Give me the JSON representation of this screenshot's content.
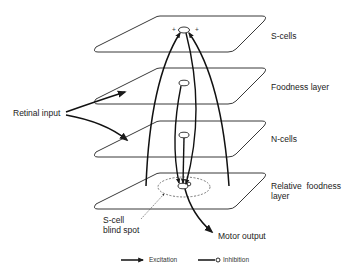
{
  "diagram": {
    "layers": [
      {
        "id": "s-cells",
        "label": "S-cells"
      },
      {
        "id": "foodness",
        "label": "Foodness layer"
      },
      {
        "id": "n-cells",
        "label": "N-cells"
      },
      {
        "id": "relative-foodness",
        "label_line1": "Relative  foodness",
        "label_line2": "layer"
      }
    ],
    "inputs": {
      "retinal": "Retinal input"
    },
    "outputs": {
      "motor": "Motor output"
    },
    "annotations": {
      "blind_spot_line1": "S-cell",
      "blind_spot_line2": "blind spot",
      "plus_left": "+",
      "plus_right": "+"
    },
    "legend": {
      "excitation": "Excitation",
      "inhibition": "Inhibition"
    },
    "colors": {
      "ink": "#1a1a1a",
      "background": "#ffffff"
    }
  }
}
